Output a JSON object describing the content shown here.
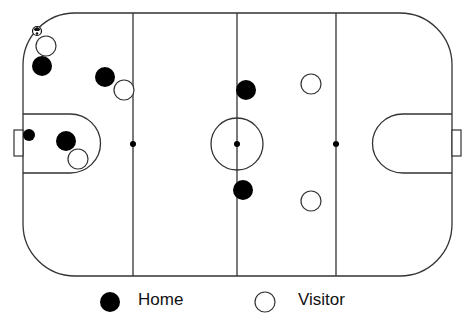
{
  "diagram": {
    "type": "hockey-rink-positions",
    "rink": {
      "x": 23,
      "y": 13,
      "width": 429,
      "height": 263,
      "corner_radius": 52,
      "line_color": "#333333"
    },
    "lines": {
      "left_blue_x": 133,
      "center_x": 237,
      "right_blue_x": 336
    },
    "center_circle": {
      "cx": 237,
      "cy": 144,
      "r": 26
    },
    "faceoff_dots": [
      {
        "cx": 133,
        "cy": 144
      },
      {
        "cx": 237,
        "cy": 144
      },
      {
        "cx": 336,
        "cy": 144
      }
    ],
    "creases": [
      {
        "side": "left",
        "x": 23,
        "y": 113,
        "width": 75,
        "height": 60
      },
      {
        "side": "right",
        "x": 377,
        "y": 113,
        "width": 75,
        "height": 60
      }
    ],
    "goals": [
      {
        "side": "left",
        "x": 14,
        "y": 130,
        "width": 9,
        "height": 26
      },
      {
        "side": "right",
        "x": 452,
        "y": 130,
        "width": 9,
        "height": 26
      }
    ],
    "puck": {
      "cx": 37,
      "cy": 31,
      "r": 4,
      "icon": "ball-icon"
    },
    "players": {
      "home": [
        {
          "cx": 42,
          "cy": 66,
          "r": 10
        },
        {
          "cx": 105,
          "cy": 77,
          "r": 10
        },
        {
          "cx": 29,
          "cy": 135,
          "r": 6
        },
        {
          "cx": 66,
          "cy": 141,
          "r": 10
        },
        {
          "cx": 246,
          "cy": 90,
          "r": 10
        },
        {
          "cx": 243,
          "cy": 190,
          "r": 10
        }
      ],
      "visitor": [
        {
          "cx": 46,
          "cy": 46,
          "r": 10
        },
        {
          "cx": 124,
          "cy": 90,
          "r": 10
        },
        {
          "cx": 78,
          "cy": 159,
          "r": 10
        },
        {
          "cx": 311,
          "cy": 84,
          "r": 10
        },
        {
          "cx": 311,
          "cy": 201,
          "r": 10
        }
      ]
    },
    "colors": {
      "home": "#000000",
      "visitor": "#ffffff",
      "outline": "#333333"
    }
  },
  "legend": {
    "home_label": "Home",
    "visitor_label": "Visitor"
  }
}
